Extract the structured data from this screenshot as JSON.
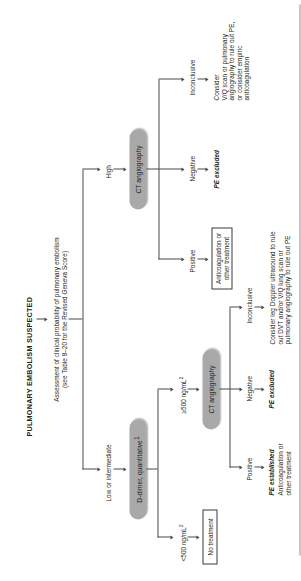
{
  "document": {
    "title": "PULMONARY EMBOLISM SUSPECTED",
    "subtitle": "Assessment of clinical probability of pulmonary embolism\n(see Table 8–20 for the Revised Geneva Score)"
  },
  "branches": {
    "low": {
      "probability_label": "Low or intermediate",
      "test": "D-dimer, quantitative",
      "test_footnote": "1",
      "results": {
        "negative_value": "<500 ng/mL",
        "negative_footnote": "2",
        "negative_action": "No treatment",
        "positive_value": "≥500 ng/mL",
        "positive_footnote": "2",
        "positive_next": "CT angiography"
      },
      "ct_outcomes": [
        {
          "label": "Positive",
          "conclusion": "PE established",
          "action": "Anticoagulation or\nother treatment"
        },
        {
          "label": "Negative",
          "conclusion": "PE excluded",
          "action": ""
        },
        {
          "label": "Inconclusive",
          "conclusion": "",
          "action": "Consider leg Doppler ultrasound to rule\nout DVT and/or V/Q lung scan or\npulmonary angiography to rule out PE"
        }
      ]
    },
    "high": {
      "probability_label": "High",
      "test": "CT angiography",
      "ct_outcomes": [
        {
          "label": "Positive",
          "conclusion": "",
          "action": "Anticoagulation or\nother treatment"
        },
        {
          "label": "Negative",
          "conclusion": "PE excluded",
          "action": ""
        },
        {
          "label": "Inconclusive",
          "conclusion": "",
          "action": "Consider\nV/Q scan or pulmonary\nangiography to rule out PE,\nor consider empiric\nanticoagulation"
        }
      ]
    }
  },
  "colors": {
    "pill_fill": "#a9a9a9",
    "ink": "#231f20",
    "connector": "#4a4a4a"
  }
}
